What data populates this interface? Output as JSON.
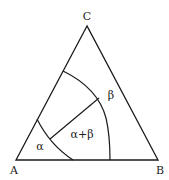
{
  "diagram": {
    "type": "ternary-phase-diagram",
    "vertices": {
      "top": "C",
      "left": "A",
      "right": "B"
    },
    "regions": [
      {
        "id": "alpha",
        "label": "α"
      },
      {
        "id": "alpha-beta",
        "label": "α+β"
      },
      {
        "id": "beta",
        "label": "β"
      }
    ],
    "line_color": "#1a1a1a"
  }
}
